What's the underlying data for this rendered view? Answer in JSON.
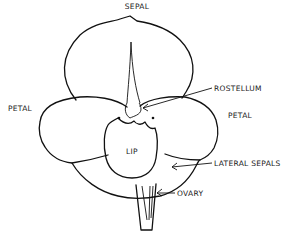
{
  "diagram": {
    "labels": {
      "sepal": "SEPAL",
      "rostellum": "ROSTELLUM",
      "petal_left": "PETAL",
      "petal_right": "PETAL",
      "lip": "LIP",
      "lateral_sepals": "LATERAL SEPALS",
      "ovary": "OVARY"
    },
    "colors": {
      "line": "#111111",
      "background": "#ffffff"
    }
  }
}
